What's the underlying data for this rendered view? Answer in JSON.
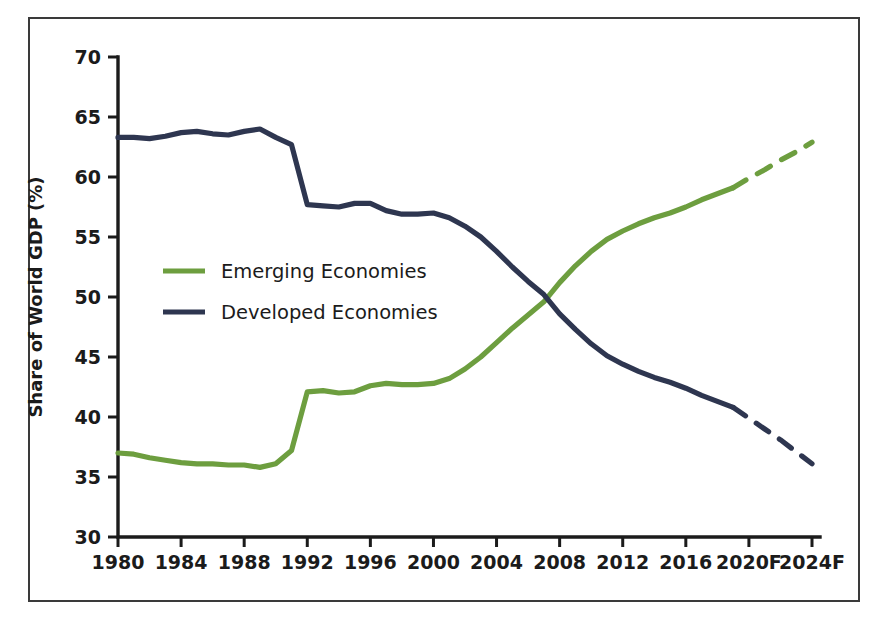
{
  "chart_data": {
    "type": "line",
    "title": "",
    "subtitle": "",
    "xlabel": "",
    "ylabel": "Share of World GDP (%)",
    "ylim": [
      30,
      70
    ],
    "ytick_values": [
      30,
      35,
      40,
      45,
      50,
      55,
      60,
      65,
      70
    ],
    "ytick_labels": [
      "30",
      "35",
      "40",
      "45",
      "50",
      "55",
      "60",
      "65",
      "70"
    ],
    "xlim": [
      1980,
      2024
    ],
    "xtick_values": [
      1980,
      1984,
      1988,
      1992,
      1996,
      2000,
      2004,
      2008,
      2012,
      2016,
      2020,
      2024
    ],
    "xtick_labels": [
      "1980",
      "1984",
      "1988",
      "1992",
      "1996",
      "2000",
      "2004",
      "2008",
      "2012",
      "2016",
      "2020F",
      "2024F"
    ],
    "grid": false,
    "legend_position": "center-left",
    "forecast_start_year": 2019,
    "forecast_note": "Years labeled with F (2020F, 2024F) are forecasts; the lines are drawn dashed from 2019 onward.",
    "x": [
      1980,
      1981,
      1982,
      1983,
      1984,
      1985,
      1986,
      1987,
      1988,
      1989,
      1990,
      1991,
      1992,
      1993,
      1994,
      1995,
      1996,
      1997,
      1998,
      1999,
      2000,
      2001,
      2002,
      2003,
      2004,
      2005,
      2006,
      2007,
      2008,
      2009,
      2010,
      2011,
      2012,
      2013,
      2014,
      2015,
      2016,
      2017,
      2018,
      2019,
      2020,
      2021,
      2022,
      2023,
      2024
    ],
    "series": [
      {
        "name": "Emerging Economies",
        "color": "#6d9e3f",
        "values": [
          37.0,
          36.9,
          36.6,
          36.4,
          36.2,
          36.1,
          36.1,
          36.0,
          36.0,
          35.8,
          36.1,
          37.2,
          42.1,
          42.2,
          42.0,
          42.1,
          42.6,
          42.8,
          42.7,
          42.7,
          42.8,
          43.2,
          44.0,
          45.0,
          46.2,
          47.4,
          48.5,
          49.6,
          51.2,
          52.6,
          53.8,
          54.8,
          55.5,
          56.1,
          56.6,
          57.0,
          57.5,
          58.1,
          58.6,
          59.1,
          59.9,
          60.6,
          61.4,
          62.1,
          62.9
        ]
      },
      {
        "name": "Developed Economies",
        "color": "#2e3650",
        "values": [
          63.3,
          63.3,
          63.2,
          63.4,
          63.7,
          63.8,
          63.6,
          63.5,
          63.8,
          64.0,
          63.3,
          62.7,
          57.7,
          57.6,
          57.5,
          57.8,
          57.8,
          57.2,
          56.9,
          56.9,
          57.0,
          56.6,
          55.9,
          55.0,
          53.8,
          52.5,
          51.3,
          50.2,
          48.6,
          47.3,
          46.1,
          45.1,
          44.4,
          43.8,
          43.3,
          42.9,
          42.4,
          41.8,
          41.3,
          40.8,
          39.9,
          39.0,
          38.1,
          37.1,
          36.1
        ]
      }
    ],
    "legend": [
      {
        "label": "Emerging Economies",
        "color": "#6d9e3f"
      },
      {
        "label": "Developed Economies",
        "color": "#2e3650"
      }
    ]
  },
  "frame": {
    "border_color": "#3a3a3a",
    "background": "#ffffff"
  }
}
